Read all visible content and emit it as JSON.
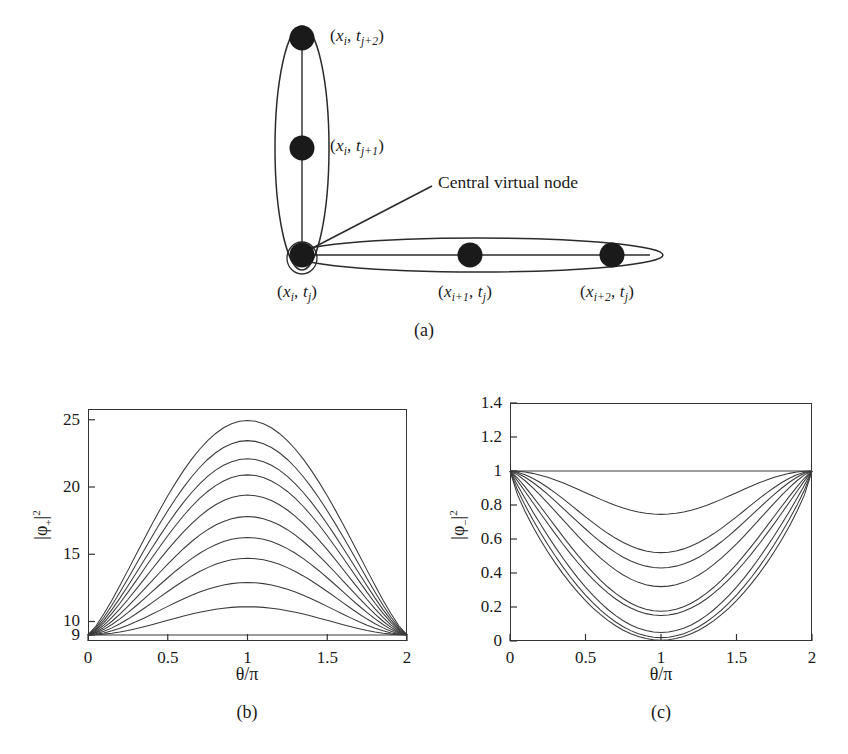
{
  "figure": {
    "panels": [
      {
        "id": "a",
        "caption": "(a)"
      },
      {
        "id": "b",
        "caption": "(b)"
      },
      {
        "id": "c",
        "caption": "(c)"
      }
    ]
  },
  "panel_a": {
    "caption": "(a)",
    "annotation": "Central virtual node",
    "nodes": [
      {
        "name": "node-xi-tj2",
        "label_paren_open": "(",
        "x_sym": "x",
        "x_sub": "i",
        "comma": ", ",
        "t_sym": "t",
        "t_sub": "j+2",
        "paren_close": ")",
        "label_plain": "(x_i, t_j+2)"
      },
      {
        "name": "node-xi-tj1",
        "label_paren_open": "(",
        "x_sym": "x",
        "x_sub": "i",
        "comma": ", ",
        "t_sym": "t",
        "t_sub": "j+1",
        "paren_close": ")",
        "label_plain": "(x_i, t_j+1)"
      },
      {
        "name": "node-xi-tj",
        "label_paren_open": "(",
        "x_sym": "x",
        "x_sub": "i",
        "comma": ", ",
        "t_sym": "t",
        "t_sub": "j",
        "paren_close": ")",
        "label_plain": "(x_i, t_j)"
      },
      {
        "name": "node-xi1-tj",
        "label_paren_open": "(",
        "x_sym": "x",
        "x_sub": "i+1",
        "comma": ", ",
        "t_sym": "t",
        "t_sub": "j",
        "paren_close": ")",
        "label_plain": "(x_i+1, t_j)"
      },
      {
        "name": "node-xi2-tj",
        "label_paren_open": "(",
        "x_sym": "x",
        "x_sub": "i+2",
        "comma": ", ",
        "t_sym": "t",
        "t_sub": "j",
        "paren_close": ")",
        "label_plain": "(x_i+2, t_j)"
      }
    ]
  },
  "chart_data": [
    {
      "id": "b",
      "type": "line",
      "caption": "(b)",
      "title": "",
      "xlabel": "θ/π",
      "ylabel": "|φ+|^2",
      "ylabel_base": "φ",
      "ylabel_sub": "+",
      "ylabel_sup": "2",
      "xlim": [
        0,
        2
      ],
      "ylim": [
        8.55,
        25.8
      ],
      "xticks": [
        0,
        0.5,
        1,
        1.5,
        2
      ],
      "xticklabels": [
        "0",
        "0.5",
        "1",
        "1.5",
        "2"
      ],
      "yticks": [
        9,
        10,
        15,
        20,
        25
      ],
      "yticklabels": [
        "9",
        "10",
        "15",
        "20",
        "25"
      ],
      "grid": false,
      "legend": "none",
      "x": [
        0,
        0.05,
        0.1,
        0.15,
        0.2,
        0.25,
        0.3,
        0.35,
        0.4,
        0.45,
        0.5,
        0.55,
        0.6,
        0.65,
        0.7,
        0.75,
        0.8,
        0.85,
        0.9,
        0.95,
        1,
        1.05,
        1.1,
        1.15,
        1.2,
        1.25,
        1.3,
        1.35,
        1.4,
        1.45,
        1.5,
        1.55,
        1.6,
        1.65,
        1.7,
        1.75,
        1.8,
        1.85,
        1.9,
        1.95,
        2
      ],
      "baseline": 9,
      "series": [
        {
          "name": "curve-1",
          "peak": 24.95,
          "sharpness": 1.6
        },
        {
          "name": "curve-2",
          "peak": 23.45,
          "sharpness": 1.55
        },
        {
          "name": "curve-3",
          "peak": 22.1,
          "sharpness": 1.5
        },
        {
          "name": "curve-4",
          "peak": 20.9,
          "sharpness": 1.45
        },
        {
          "name": "curve-5",
          "peak": 19.4,
          "sharpness": 1.4
        },
        {
          "name": "curve-6",
          "peak": 17.8,
          "sharpness": 1.35
        },
        {
          "name": "curve-7",
          "peak": 16.25,
          "sharpness": 1.3
        },
        {
          "name": "curve-8",
          "peak": 14.7,
          "sharpness": 1.22
        },
        {
          "name": "curve-9",
          "peak": 12.9,
          "sharpness": 1.14
        },
        {
          "name": "curve-10",
          "peak": 11.1,
          "sharpness": 1.05
        },
        {
          "name": "curve-flat",
          "peak": 9.0,
          "sharpness": 1.0
        }
      ]
    },
    {
      "id": "c",
      "type": "line",
      "caption": "(c)",
      "title": "",
      "xlabel": "θ/π",
      "ylabel": "|φ-|^2",
      "ylabel_base": "φ",
      "ylabel_sub": "−",
      "ylabel_sup": "2",
      "xlim": [
        0,
        2
      ],
      "ylim": [
        0,
        1.4
      ],
      "xticks": [
        0,
        0.5,
        1,
        1.5,
        2
      ],
      "xticklabels": [
        "0",
        "0.5",
        "1",
        "1.5",
        "2"
      ],
      "yticks": [
        0,
        0.2,
        0.4,
        0.6,
        0.8,
        1,
        1.2,
        1.4
      ],
      "yticklabels": [
        "0",
        "0.2",
        "0.4",
        "0.6",
        "0.8",
        "1",
        "1.2",
        "1.4"
      ],
      "grid": false,
      "legend": "none",
      "x": [
        0,
        0.05,
        0.1,
        0.15,
        0.2,
        0.25,
        0.3,
        0.35,
        0.4,
        0.45,
        0.5,
        0.55,
        0.6,
        0.65,
        0.7,
        0.75,
        0.8,
        0.85,
        0.9,
        0.95,
        1,
        1.05,
        1.1,
        1.15,
        1.2,
        1.25,
        1.3,
        1.35,
        1.4,
        1.45,
        1.5,
        1.55,
        1.6,
        1.65,
        1.7,
        1.75,
        1.8,
        1.85,
        1.9,
        1.95,
        2
      ],
      "top": 1.0,
      "series": [
        {
          "name": "curve-flat",
          "min": 1.0,
          "sharpness": 1.0
        },
        {
          "name": "curve-1",
          "min": 0.745,
          "sharpness": 1.0
        },
        {
          "name": "curve-2",
          "min": 0.52,
          "sharpness": 1.2
        },
        {
          "name": "curve-3",
          "min": 0.43,
          "sharpness": 1.35
        },
        {
          "name": "curve-4",
          "min": 0.32,
          "sharpness": 1.5
        },
        {
          "name": "curve-5",
          "min": 0.175,
          "sharpness": 1.7
        },
        {
          "name": "curve-6",
          "min": 0.15,
          "sharpness": 1.9
        },
        {
          "name": "curve-7",
          "min": 0.05,
          "sharpness": 2.1
        },
        {
          "name": "curve-8",
          "min": 0.02,
          "sharpness": 2.35
        },
        {
          "name": "curve-9",
          "min": 0.005,
          "sharpness": 2.6
        }
      ]
    }
  ]
}
